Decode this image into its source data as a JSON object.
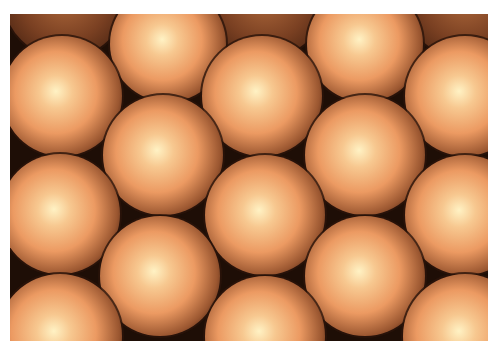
{
  "image": {
    "subject": "close-packed copper-colored spheres",
    "frame": {
      "x": 10,
      "y": 14,
      "width": 478,
      "height": 327
    },
    "colors": {
      "background": "#ffffff",
      "gap": "#1e0e06",
      "highlight": "#fff2c4",
      "mid": "#ec9a62",
      "shade": "#9a5630",
      "edge": "#4a2412"
    },
    "sphere_radius": 60,
    "spheres": [
      {
        "cx": 55,
        "cy": -18,
        "r": 62,
        "dim": true
      },
      {
        "cx": 255,
        "cy": -18,
        "r": 62,
        "dim": true
      },
      {
        "cx": 455,
        "cy": -18,
        "r": 62,
        "dim": true
      },
      {
        "cx": 158,
        "cy": 30,
        "r": 58
      },
      {
        "cx": 355,
        "cy": 30,
        "r": 58
      },
      {
        "cx": 52,
        "cy": 82,
        "r": 60
      },
      {
        "cx": 252,
        "cy": 82,
        "r": 60
      },
      {
        "cx": 455,
        "cy": 82,
        "r": 60
      },
      {
        "cx": 153,
        "cy": 141,
        "r": 60
      },
      {
        "cx": 355,
        "cy": 141,
        "r": 60
      },
      {
        "cx": 50,
        "cy": 200,
        "r": 60
      },
      {
        "cx": 255,
        "cy": 201,
        "r": 60
      },
      {
        "cx": 455,
        "cy": 201,
        "r": 60
      },
      {
        "cx": 150,
        "cy": 262,
        "r": 60
      },
      {
        "cx": 355,
        "cy": 262,
        "r": 60
      },
      {
        "cx": 50,
        "cy": 322,
        "r": 62
      },
      {
        "cx": 255,
        "cy": 322,
        "r": 60
      },
      {
        "cx": 455,
        "cy": 322,
        "r": 62
      }
    ]
  }
}
